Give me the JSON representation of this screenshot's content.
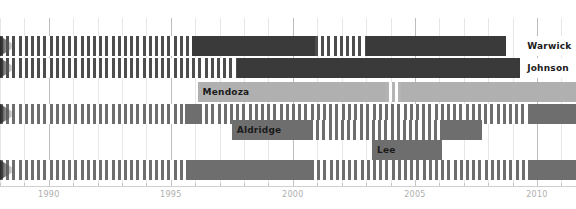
{
  "chart_data": {
    "type": "bar",
    "title": "",
    "xlabel": "",
    "ylabel": "",
    "orientation": "horizontal-timeline",
    "grid": true,
    "legend_position": "inline-labels",
    "xlim": [
      1988.0,
      2011.6
    ],
    "xtick_labels": [
      "1990",
      "1995",
      "2000",
      "2005",
      "2010"
    ],
    "xtick_values": [
      1990,
      1995,
      2000,
      2005,
      2010
    ],
    "minor_tick_step": 1,
    "colors": {
      "dark": "#3a3a3a",
      "mid": "#6e6e6e",
      "light": "#b0b0b0",
      "hatch_stripe": "#6d6d6d",
      "hatch_stripe_light": "#b4b4b4",
      "background": "#ffffff",
      "gridline": "#c9c9c9",
      "tick_label": "#aeaeae"
    },
    "series": [
      {
        "name": "Warwick",
        "row": 1,
        "label_visible": true,
        "label_x": 2009.6,
        "continues_left": true,
        "segments": [
          {
            "start": 1988.0,
            "end": 1995.85,
            "style": "hatch",
            "color": "#4d4d4d"
          },
          {
            "start": 1995.85,
            "end": 2000.9,
            "style": "solid",
            "color": "#3a3a3a"
          },
          {
            "start": 2000.9,
            "end": 2003.0,
            "style": "hatch",
            "color": "#4d4d4d"
          },
          {
            "start": 2003.0,
            "end": 2008.75,
            "style": "solid",
            "color": "#3a3a3a"
          }
        ]
      },
      {
        "name": "Johnson",
        "row": 2,
        "label_visible": true,
        "label_x": 2009.6,
        "continues_left": true,
        "segments": [
          {
            "start": 1988.0,
            "end": 1997.7,
            "style": "hatch",
            "color": "#4d4d4d"
          },
          {
            "start": 1997.7,
            "end": 2011.6,
            "style": "solid",
            "color": "#3a3a3a"
          }
        ]
      },
      {
        "name": "Mendoza",
        "row": 3,
        "label_visible": true,
        "label_x": 1996.3,
        "continues_left": false,
        "segments": [
          {
            "start": 1996.1,
            "end": 2003.8,
            "style": "solid",
            "color": "#b0b0b0"
          },
          {
            "start": 2003.8,
            "end": 2004.45,
            "style": "hatch",
            "color": "#b4b4b4"
          },
          {
            "start": 2004.45,
            "end": 2011.6,
            "style": "solid",
            "color": "#b0b0b0"
          }
        ]
      },
      {
        "name": "",
        "row": 4,
        "label_visible": false,
        "label_x": null,
        "continues_left": true,
        "segments": [
          {
            "start": 1988.0,
            "end": 1995.6,
            "style": "hatch",
            "color": "#6e6e6e"
          },
          {
            "start": 1995.6,
            "end": 1996.15,
            "style": "solid",
            "color": "#6e6e6e"
          },
          {
            "start": 1996.15,
            "end": 2009.75,
            "style": "hatch",
            "color": "#6e6e6e"
          },
          {
            "start": 2009.75,
            "end": 2011.6,
            "style": "solid",
            "color": "#6e6e6e"
          }
        ]
      },
      {
        "name": "Aldridge",
        "row": 5,
        "label_visible": true,
        "label_x": 1997.7,
        "continues_left": false,
        "segments": [
          {
            "start": 1997.5,
            "end": 2000.7,
            "style": "solid",
            "color": "#6e6e6e"
          },
          {
            "start": 2000.7,
            "end": 2006.1,
            "style": "hatch",
            "color": "#6e6e6e"
          },
          {
            "start": 2006.1,
            "end": 2007.75,
            "style": "solid",
            "color": "#6e6e6e"
          }
        ]
      },
      {
        "name": "Lee",
        "row": 6,
        "label_visible": true,
        "label_x": 2003.45,
        "continues_left": false,
        "segments": [
          {
            "start": 2003.25,
            "end": 2006.1,
            "style": "solid",
            "color": "#6e6e6e"
          }
        ]
      },
      {
        "name": "",
        "row": 7,
        "label_visible": false,
        "label_x": null,
        "continues_left": true,
        "segments": [
          {
            "start": 1988.0,
            "end": 1995.65,
            "style": "hatch",
            "color": "#6e6e6e"
          },
          {
            "start": 1995.65,
            "end": 2000.75,
            "style": "solid",
            "color": "#6e6e6e"
          },
          {
            "start": 2000.75,
            "end": 2009.75,
            "style": "hatch",
            "color": "#6e6e6e"
          },
          {
            "start": 2009.75,
            "end": 2011.6,
            "style": "solid",
            "color": "#6e6e6e"
          }
        ]
      }
    ],
    "inline_labels": [
      {
        "text": "Warwick",
        "series": "Warwick",
        "color": "#ffffff",
        "text_color": "#1b1b1b"
      },
      {
        "text": "Johnson",
        "series": "Johnson",
        "color": "#ffffff",
        "text_color": "#1b1b1b"
      },
      {
        "text": "Mendoza",
        "series": "Mendoza",
        "color": "#b0b0b0",
        "text_color": "#1b1b1b"
      },
      {
        "text": "Aldridge",
        "series": "Aldridge",
        "color": "#6e6e6e",
        "text_color": "#1b1b1b"
      },
      {
        "text": "Lee",
        "series": "Lee",
        "color": "#6e6e6e",
        "text_color": "#1b1b1b"
      }
    ]
  },
  "axis": {
    "ticks": [
      {
        "label": "1990"
      },
      {
        "label": "1995"
      },
      {
        "label": "2000"
      },
      {
        "label": "2005"
      },
      {
        "label": "2010"
      }
    ]
  },
  "labels": {
    "warwick": "Warwick",
    "johnson": "Johnson",
    "mendoza": "Mendoza",
    "aldridge": "Aldridge",
    "lee": "Lee"
  }
}
